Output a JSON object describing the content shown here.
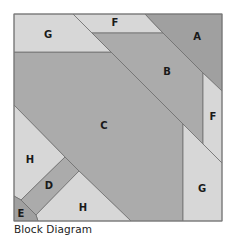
{
  "caption": "Block Diagram",
  "colors": {
    "light": "#d7d7d7",
    "medium": "#ababab",
    "dark": "#a0a0a0",
    "stroke": "#6e6e6e"
  },
  "pieces": [
    {
      "id": "A",
      "label": "A",
      "shade": "dark"
    },
    {
      "id": "B",
      "label": "B",
      "shade": "medium"
    },
    {
      "id": "C",
      "label": "C",
      "shade": "medium"
    },
    {
      "id": "D",
      "label": "D",
      "shade": "medium"
    },
    {
      "id": "E",
      "label": "E",
      "shade": "dark"
    },
    {
      "id": "F-top",
      "label": "F",
      "shade": "light"
    },
    {
      "id": "F-right",
      "label": "F",
      "shade": "light"
    },
    {
      "id": "G-top",
      "label": "G",
      "shade": "light"
    },
    {
      "id": "G-right",
      "label": "G",
      "shade": "light"
    },
    {
      "id": "H-left",
      "label": "H",
      "shade": "light"
    },
    {
      "id": "H-bottom",
      "label": "H",
      "shade": "light"
    }
  ]
}
